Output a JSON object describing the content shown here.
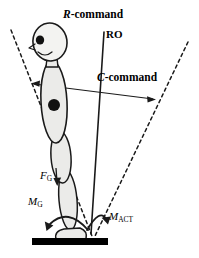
{
  "figure": {
    "width": 199,
    "height": 258,
    "background_color": "#ffffff",
    "stroke_color": "#000000",
    "body_fill_color": "#ebebe9",
    "ground_color": "#000000"
  },
  "labels": {
    "r_command": {
      "italic": "R",
      "rest": "-command"
    },
    "ro": "RO",
    "c_command": {
      "italic": "C",
      "rest": "-command"
    },
    "f_gravity": {
      "italic": "F",
      "subscript": "G"
    },
    "m_gravity": {
      "italic": "M",
      "subscript": "G"
    },
    "m_active": {
      "italic": "M",
      "subscript": "ACT"
    }
  },
  "elements": {
    "head": "head-oval-with-face",
    "eye": "eye-dot",
    "nose": "nose-profile",
    "mouth": "mouth-smile",
    "neck": "neck-segment",
    "trunk": "trunk-ellipse",
    "center-of-mass": "center-of-mass-dot",
    "thigh": "thigh-ellipse",
    "shank": "shank-ellipse",
    "foot": "foot-shape",
    "ground": "ground-bar",
    "ro-line": "ro-reference-line",
    "left-boundary": "left-dashed-boundary-line",
    "right-boundary": "right-dashed-boundary-line",
    "gravity-line": "gravity-dashed-line",
    "c-command-arrow": "c-command-double-arrow",
    "f-gravity-arrow": "gravity-force-arrow",
    "m-gravity-arrow": "gravity-moment-curved-arrow",
    "m-active-arrow": "active-moment-curved-arrow"
  }
}
